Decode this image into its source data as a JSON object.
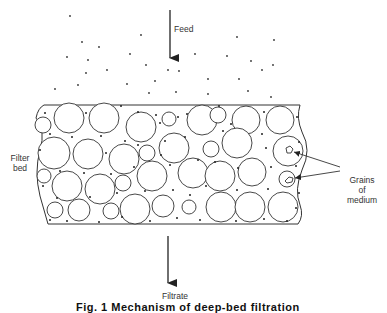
{
  "figure": {
    "labels": {
      "feed": "Feed",
      "filter_bed_line1": "Filter",
      "filter_bed_line2": "bed",
      "grains_line1": "Grains",
      "grains_line2": "of",
      "grains_line3": "medium",
      "filtrate": "Filtrate"
    },
    "caption": "Fig. 1  Mechanism of deep-bed filtration",
    "caption_note": "caption partially cropped at bottom edge",
    "colors": {
      "background": "#ffffff",
      "stroke": "#333333",
      "particle": "#222222"
    },
    "flow_direction": "top-to-bottom"
  }
}
